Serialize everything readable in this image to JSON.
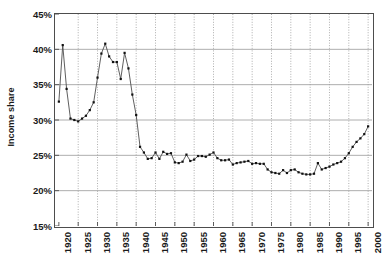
{
  "chart_data": {
    "type": "line",
    "title": "",
    "xlabel": "",
    "ylabel": "Income share",
    "xlim": [
      1919,
      2001
    ],
    "ylim": [
      15,
      45
    ],
    "ytick_labels": [
      "45%",
      "40%",
      "35%",
      "30%",
      "25%",
      "20%",
      "15%"
    ],
    "ytick_values": [
      45,
      40,
      35,
      30,
      25,
      20,
      15
    ],
    "xtick_labels": [
      "1920",
      "1925",
      "1930",
      "1935",
      "1940",
      "1945",
      "1950",
      "1955",
      "1960",
      "1965",
      "1970",
      "1975",
      "1980",
      "1985",
      "1990",
      "1995",
      "2000"
    ],
    "xtick_values": [
      1920,
      1925,
      1930,
      1935,
      1940,
      1945,
      1950,
      1955,
      1960,
      1965,
      1970,
      1975,
      1980,
      1985,
      1990,
      1995,
      2000
    ],
    "grid": {
      "horizontal": true,
      "vertical": true,
      "horizontal_style": "solid-grey",
      "vertical_style": "dotted-grey"
    },
    "legend": null,
    "marker": "filled-square",
    "line_color": "#4d4d4d",
    "marker_color": "#111111",
    "grid_color": "#999999",
    "axis_color": "#4d4d4d",
    "x": [
      1920,
      1921,
      1922,
      1923,
      1924,
      1925,
      1926,
      1927,
      1928,
      1929,
      1930,
      1931,
      1932,
      1933,
      1934,
      1935,
      1936,
      1937,
      1938,
      1939,
      1940,
      1941,
      1942,
      1943,
      1944,
      1945,
      1946,
      1947,
      1948,
      1949,
      1950,
      1951,
      1952,
      1953,
      1954,
      1955,
      1956,
      1957,
      1958,
      1959,
      1960,
      1961,
      1962,
      1963,
      1964,
      1965,
      1966,
      1967,
      1968,
      1969,
      1970,
      1971,
      1972,
      1973,
      1974,
      1975,
      1976,
      1977,
      1978,
      1979,
      1980,
      1981,
      1982,
      1983,
      1984,
      1985,
      1986,
      1987,
      1988,
      1989,
      1990,
      1991,
      1992,
      1993,
      1994,
      1995,
      1996,
      1997,
      1998,
      1999,
      2000
    ],
    "y": [
      32.6,
      40.6,
      34.4,
      30.2,
      30.0,
      29.8,
      30.2,
      30.6,
      31.4,
      32.5,
      36.0,
      39.4,
      40.8,
      39.0,
      38.2,
      38.2,
      35.8,
      39.5,
      37.3,
      33.6,
      30.7,
      26.2,
      25.4,
      24.5,
      24.6,
      25.4,
      24.5,
      25.5,
      25.2,
      25.3,
      24.0,
      23.9,
      24.1,
      25.1,
      24.2,
      24.4,
      24.9,
      24.9,
      24.8,
      25.1,
      25.4,
      24.6,
      24.3,
      24.3,
      24.4,
      23.7,
      23.9,
      24.0,
      24.1,
      24.2,
      23.8,
      23.9,
      23.8,
      23.8,
      23.0,
      22.6,
      22.5,
      22.4,
      22.9,
      22.5,
      22.9,
      23.0,
      22.6,
      22.4,
      22.3,
      22.3,
      22.4,
      23.9,
      23.0,
      23.2,
      23.4,
      23.7,
      23.9,
      24.1,
      24.6,
      25.3,
      26.2,
      26.9,
      27.4,
      28.0,
      29.1
    ]
  },
  "axis": {
    "ylabel_text": "Income share"
  }
}
